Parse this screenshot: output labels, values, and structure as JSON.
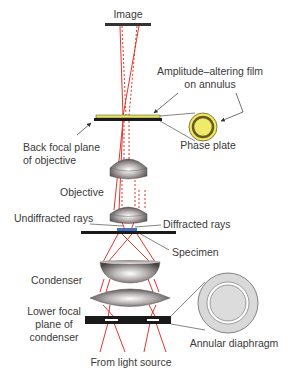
{
  "diagram": {
    "labels": {
      "image": "Image",
      "amplitude_film_line1": "Amplitude–altering film",
      "amplitude_film_line2": "on annulus",
      "back_focal_line1": "Back focal plane",
      "back_focal_line2": "of objective",
      "phase_plate": "Phase plate",
      "objective": "Objective",
      "undiffracted": "Undiffracted rays",
      "diffracted": "Diffracted rays",
      "specimen": "Specimen",
      "condenser": "Condenser",
      "lower_focal_line1": "Lower focal",
      "lower_focal_line2": "plane of",
      "lower_focal_line3": "condenser",
      "annular_diaphragm": "Annular diaphragm",
      "light_source": "From light source"
    },
    "colors": {
      "ray": "#e0362c",
      "plate_black": "#1a1a1a",
      "film_yellow": "#e6e25a",
      "phase_plate_fill": "#eeea6a",
      "phase_plate_ring": "#6b5a1e",
      "diaphragm_fill": "#d9d9d9",
      "specimen_blue": "#3a78c8",
      "leader_line": "#333333"
    }
  }
}
